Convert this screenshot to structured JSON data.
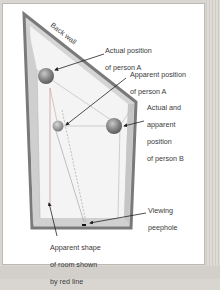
{
  "diagram": {
    "labels": {
      "back_wall": "Back wall",
      "actual_a": [
        "Actual position",
        "of person A"
      ],
      "apparent_a": [
        "Apparent position",
        "of person A"
      ],
      "person_b": [
        "Actual and",
        "apparent",
        "position",
        "of person B"
      ],
      "peephole": [
        "Viewing",
        "peephole"
      ],
      "apparent_shape": [
        "Apparent shape",
        "of room shown",
        "by red line"
      ]
    },
    "colors": {
      "wall_border": "#7a7a7a",
      "wall_fill": "#d8d8d8",
      "floor_fill": "#ededed",
      "sphere": "#7f7f7f",
      "red_line": "#c9a0a0",
      "arrow": "#222222",
      "text": "#3a3a3a"
    }
  }
}
